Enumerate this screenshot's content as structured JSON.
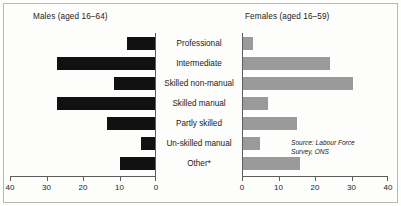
{
  "panels": {
    "males_title": "Males (aged 16–64)",
    "females_title": "Females (aged 16–59)"
  },
  "source_note": {
    "line1": "Source:  Labour Force",
    "line2": "Survey, ONS"
  },
  "chart_data": {
    "type": "bar",
    "title": "",
    "subtitle": "",
    "orientation": "horizontal",
    "layout": "population-pyramid",
    "categories": [
      "Professional",
      "Intermediate",
      "Skilled non-manual",
      "Skilled manual",
      "Partly skilled",
      "Un-skilled manual",
      "Other*"
    ],
    "series": [
      {
        "name": "Males (aged 16–64)",
        "side": "left",
        "color": "#111111",
        "values": [
          8,
          27,
          11.5,
          27,
          13.5,
          4,
          10
        ]
      },
      {
        "name": "Females (aged 16–59)",
        "side": "right",
        "color": "#9a9a9a",
        "values": [
          3,
          24,
          30.5,
          7,
          15,
          5,
          16
        ]
      }
    ],
    "xlabel": "",
    "ylabel": "",
    "xlim": [
      0,
      40
    ],
    "ticks": [
      0,
      10,
      20,
      30,
      40
    ],
    "males_tick_labels": [
      "40",
      "30",
      "20",
      "10",
      "0"
    ],
    "females_tick_labels": [
      "0",
      "10",
      "20",
      "30",
      "40"
    ],
    "grid": false,
    "legend": "none",
    "annotations": [
      "Source:  Labour Force Survey, ONS"
    ]
  }
}
